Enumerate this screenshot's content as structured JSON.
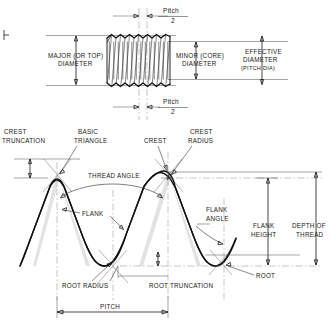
{
  "figure": {
    "type": "engineering-line-drawing",
    "ink_color": "#1a1a1a",
    "background_color": "#ffffff"
  },
  "top_view": {
    "name": "external-threaded-shaft-elevation",
    "labels": {
      "pitch_top_word": "Pitch",
      "pitch_top_denominator": "2",
      "pitch_bottom_word": "Pitch",
      "pitch_bottom_denominator": "2",
      "major_diameter_line1": "MAJOR (OR TOP)",
      "major_diameter_line2": "DIAMETER",
      "minor_diameter_line1": "MINOR (CORE)",
      "minor_diameter_line2": "DIAMETER",
      "effective_diameter_line1": "EFFECTIVE",
      "effective_diameter_line2": "DIAMETER",
      "effective_diameter_line3": "(PITCH  DIA)"
    },
    "thread_count": 7
  },
  "profile_view": {
    "name": "thread-profile-detail",
    "labels": {
      "crest_truncation_line1": "CREST",
      "crest_truncation_line2": "TRUNCATION",
      "basic_triangle_line1": "BASIC",
      "basic_triangle_line2": "TRIANGLE",
      "crest": "CREST",
      "crest_radius_line1": "CREST",
      "crest_radius_line2": "RADIUS",
      "thread_angle": "THREAD ANGLE",
      "flank": "FLANK",
      "flank_angle_line1": "FLANK",
      "flank_angle_line2": "ANGLE",
      "flank_height_line1": "FLANK",
      "flank_height_line2": "HEIGHT",
      "depth_of_thread_line1": "DEPTH OF",
      "depth_of_thread_line2": "THREAD",
      "root_radius": "ROOT RADIUS",
      "root_truncation": "ROOT TRUNCATION",
      "root": "ROOT",
      "pitch": "PITCH"
    }
  }
}
